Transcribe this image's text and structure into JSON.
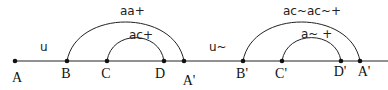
{
  "diagram": {
    "baseline": {
      "y": 61,
      "x_start": 15,
      "x_end": 388,
      "color": "#222222"
    },
    "points": [
      {
        "id": "A",
        "label": "A",
        "x": 15,
        "label_x": 17,
        "label_y": 82
      },
      {
        "id": "B",
        "label": "B",
        "x": 67,
        "label_x": 66,
        "label_y": 78
      },
      {
        "id": "C",
        "label": "C",
        "x": 107,
        "label_x": 106,
        "label_y": 78
      },
      {
        "id": "D",
        "label": "D",
        "x": 164,
        "label_x": 160,
        "label_y": 78
      },
      {
        "id": "A1",
        "label": "A'",
        "x": 184,
        "label_x": 189,
        "label_y": 85
      },
      {
        "id": "B1",
        "label": "B'",
        "x": 243,
        "label_x": 242,
        "label_y": 78
      },
      {
        "id": "C1",
        "label": "C'",
        "x": 282,
        "label_x": 281,
        "label_y": 78
      },
      {
        "id": "D1",
        "label": "D'",
        "x": 341,
        "label_x": 340,
        "label_y": 76
      },
      {
        "id": "A2",
        "label": "A'",
        "x": 360,
        "label_x": 364,
        "label_y": 76
      }
    ],
    "segment_labels": [
      {
        "text": "u",
        "x": 40,
        "y": 51
      },
      {
        "text": "u~",
        "x": 209,
        "y": 51
      }
    ],
    "arcs": [
      {
        "from": "B",
        "to": "A1",
        "x1": 67,
        "x2": 184,
        "height": 40,
        "label": "aa+",
        "label_x": 120,
        "label_y": 15
      },
      {
        "from": "C",
        "to": "D",
        "x1": 107,
        "x2": 164,
        "height": 24,
        "label": "ac+",
        "label_x": 129,
        "label_y": 39
      },
      {
        "from": "B1",
        "to": "A2",
        "x1": 243,
        "x2": 360,
        "height": 40,
        "label": "ac~ac~+",
        "label_x": 283,
        "label_y": 15
      },
      {
        "from": "C1",
        "to": "D1",
        "x1": 282,
        "x2": 341,
        "height": 24,
        "label": "a~ +",
        "label_x": 301,
        "label_y": 38
      }
    ]
  }
}
